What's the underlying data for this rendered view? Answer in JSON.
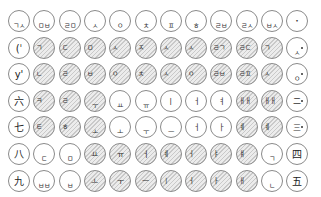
{
  "grid": {
    "columns": 12,
    "rows": 7,
    "cells": [
      [
        {
          "g": "ㄱㅅ",
          "s": "b",
          "h": 0
        },
        {
          "g": "ㅁㅂ",
          "s": "b",
          "h": 0
        },
        {
          "g": "ㄹㅁ",
          "s": "b",
          "h": 0
        },
        {
          "g": "ㅅ",
          "s": "b",
          "h": 0
        },
        {
          "g": "ㅇ",
          "s": "b",
          "h": 0
        },
        {
          "g": "ㅊ",
          "s": "b",
          "h": 0
        },
        {
          "g": "ㅍ",
          "s": "b",
          "h": 0
        },
        {
          "g": "ㅎ",
          "s": "b",
          "h": 0
        },
        {
          "g": "ㄹㅂ",
          "s": "b",
          "h": 0
        },
        {
          "g": "ㄹㅅ",
          "s": "b",
          "h": 0
        },
        {
          "g": "ㅂㅅ",
          "s": "b",
          "h": 0
        },
        {
          "g": "・",
          "s": "c",
          "h": 0
        }
      ],
      [
        {
          "g": "(ˈ",
          "s": "B",
          "h": 0
        },
        {
          "g": "ㄱ",
          "s": "t",
          "h": 1
        },
        {
          "g": "ㄷ",
          "s": "t",
          "h": 1
        },
        {
          "g": "ㅁ",
          "s": "t",
          "h": 1
        },
        {
          "g": "ㅅ",
          "s": "t",
          "h": 1
        },
        {
          "g": "ㅈ",
          "s": "t",
          "h": 1
        },
        {
          "g": "ㅅ",
          "s": "t",
          "h": 1
        },
        {
          "g": "ㅅ",
          "s": "t",
          "h": 1
        },
        {
          "g": "ㄹㄱ",
          "s": "t",
          "h": 1
        },
        {
          "g": "ㄹㄷ",
          "s": "t",
          "h": 1
        },
        {
          "g": "ㄱ",
          "s": "t",
          "h": 1
        },
        {
          "g": "ㅅ",
          "s": "b",
          "h": 0,
          "dot": 1
        }
      ],
      [
        {
          "g": "y'",
          "s": "B",
          "h": 0
        },
        {
          "g": "ㄴ",
          "s": "t",
          "h": 1
        },
        {
          "g": "ㄹ",
          "s": "t",
          "h": 1
        },
        {
          "g": "ㅂ",
          "s": "t",
          "h": 1
        },
        {
          "g": "ㅇ",
          "s": "t",
          "h": 1
        },
        {
          "g": "ㅊ",
          "s": "t",
          "h": 1
        },
        {
          "g": "ㅅ",
          "s": "t",
          "h": 1
        },
        {
          "g": "ㅇ",
          "s": "t",
          "h": 1
        },
        {
          "g": "ㄹㅂ",
          "s": "t",
          "h": 1
        },
        {
          "g": "ㄹㅍ",
          "s": "t",
          "h": 1
        },
        {
          "g": "ㅅ",
          "s": "t",
          "h": 1
        },
        {
          "g": "ㅇ",
          "s": "b",
          "h": 0,
          "dot": 1
        }
      ],
      [
        {
          "g": "六",
          "s": "B",
          "h": 0
        },
        {
          "g": "ㅋ",
          "s": "t",
          "h": 1
        },
        {
          "g": "ㄹ",
          "s": "t",
          "h": 1
        },
        {
          "g": "ㅜ",
          "s": "b",
          "h": 1
        },
        {
          "g": "ㅛ",
          "s": "b",
          "h": 0
        },
        {
          "g": "ㅠ",
          "s": "b",
          "h": 0
        },
        {
          "g": "ㅣ",
          "s": "c",
          "h": 0
        },
        {
          "g": "ㅓ",
          "s": "c",
          "h": 0
        },
        {
          "g": "ㅕ",
          "s": "c",
          "h": 0
        },
        {
          "g": "ㅐㅐ",
          "s": "t",
          "h": 1
        },
        {
          "g": "ㅐㅐ",
          "s": "t",
          "h": 1
        },
        {
          "g": "二",
          "s": "c",
          "h": 0,
          "dot": 1
        }
      ],
      [
        {
          "g": "七",
          "s": "B",
          "h": 0
        },
        {
          "g": "ㅌ",
          "s": "t",
          "h": 1
        },
        {
          "g": "ㅎ",
          "s": "t",
          "h": 1
        },
        {
          "g": "ㅗ",
          "s": "b",
          "h": 1
        },
        {
          "g": "ㅗ",
          "s": "b",
          "h": 0
        },
        {
          "g": "ㅜ",
          "s": "b",
          "h": 0
        },
        {
          "g": "ㅡ",
          "s": "b",
          "h": 0
        },
        {
          "g": "ㅓ",
          "s": "c",
          "h": 0
        },
        {
          "g": "ㅏ",
          "s": "c",
          "h": 0
        },
        {
          "g": "ㅖ",
          "s": "t",
          "h": 1
        },
        {
          "g": "ㅖ",
          "s": "t",
          "h": 1
        },
        {
          "g": "三",
          "s": "c",
          "h": 0,
          "dot": 1
        }
      ],
      [
        {
          "g": "八",
          "s": "B",
          "h": 0
        },
        {
          "g": "ㄷ",
          "s": "b",
          "h": 0
        },
        {
          "g": "ㅁ",
          "s": "b",
          "h": 0
        },
        {
          "g": "ㅛ",
          "s": "c",
          "h": 1
        },
        {
          "g": "ㅠ",
          "s": "c",
          "h": 1
        },
        {
          "g": "ㅓ",
          "s": "c",
          "h": 1
        },
        {
          "g": "ㅖ",
          "s": "t",
          "h": 1
        },
        {
          "g": "ㅓ",
          "s": "t",
          "h": 1
        },
        {
          "g": "ㅑ",
          "s": "t",
          "h": 1
        },
        {
          "g": "ㅒ",
          "s": "t",
          "h": 1
        },
        {
          "g": "ㄱ",
          "s": "b",
          "h": 0
        },
        {
          "g": "四",
          "s": "B",
          "h": 0
        }
      ],
      [
        {
          "g": "九",
          "s": "B",
          "h": 0
        },
        {
          "g": "ㅂㅂ",
          "s": "b",
          "h": 0
        },
        {
          "g": "ㅂ",
          "s": "b",
          "h": 0
        },
        {
          "g": "ㅗ",
          "s": "c",
          "h": 1
        },
        {
          "g": "ㅜ",
          "s": "c",
          "h": 1
        },
        {
          "g": "ㅡ",
          "s": "c",
          "h": 1
        },
        {
          "g": "ㅣ",
          "s": "t",
          "h": 1
        },
        {
          "g": "ㅓ",
          "s": "t",
          "h": 1
        },
        {
          "g": "ㅏ",
          "s": "t",
          "h": 1
        },
        {
          "g": "ㅐ",
          "s": "t",
          "h": 1
        },
        {
          "g": "ㄴ",
          "s": "b",
          "h": 0
        },
        {
          "g": "五",
          "s": "B",
          "h": 0
        }
      ]
    ]
  }
}
